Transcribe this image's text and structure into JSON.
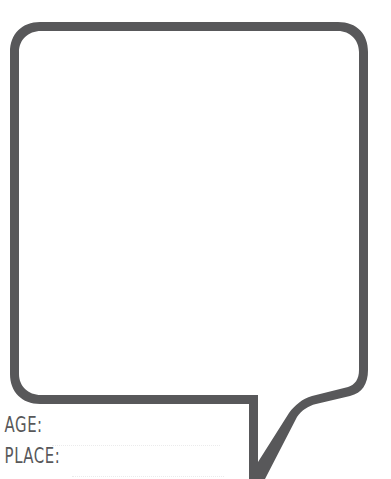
{
  "page": {
    "background_color": "#ffffff"
  },
  "bubble": {
    "name": "speech-bubble",
    "outline_color": "#58585a",
    "fill_color": "#ffffff",
    "stroke_width_px": 9,
    "corner_radius_px": 28,
    "tail_direction": "down-right",
    "body_rect": {
      "left": 10,
      "top": 22,
      "right": 368,
      "bottom": 400
    }
  },
  "form": {
    "fields": [
      {
        "label": "AGE:",
        "value": "",
        "placeholder": "",
        "line_style": "dotted",
        "line_color": "#ebebec"
      },
      {
        "label": "PLACE:",
        "value": "",
        "placeholder": "",
        "line_style": "dotted",
        "line_color": "#ebebec"
      }
    ]
  }
}
